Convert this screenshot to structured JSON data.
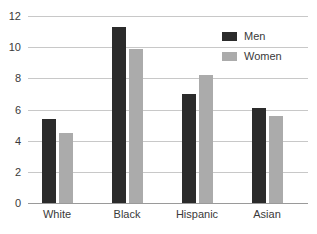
{
  "chart_data": {
    "type": "bar",
    "title": "",
    "xlabel": "",
    "ylabel": "",
    "categories": [
      "White",
      "Black",
      "Hispanic",
      "Asian"
    ],
    "series": [
      {
        "name": "Men",
        "color": "#2b2b2b",
        "values": [
          5.4,
          11.3,
          7.0,
          6.1
        ]
      },
      {
        "name": "Women",
        "color": "#ababab",
        "values": [
          4.5,
          9.9,
          8.2,
          5.6
        ]
      }
    ],
    "ylim": [
      0,
      12
    ],
    "yticks": [
      0,
      2,
      4,
      6,
      8,
      10,
      12
    ],
    "ytick_labels": [
      "0",
      "2",
      "4",
      "6",
      "8",
      "10",
      "12"
    ],
    "grid": true,
    "grid_axis": "y",
    "legend_position": "top-right",
    "background": "#ffffff",
    "grid_color": "#c8c8c8",
    "axis_color": "#9a9a9a",
    "text_color": "#3a3a3a"
  }
}
